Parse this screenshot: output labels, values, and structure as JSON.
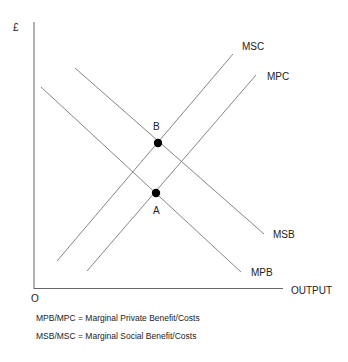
{
  "diagram": {
    "axes": {
      "y_label": "£",
      "x_label": "OUTPUT",
      "origin_label": "O"
    },
    "curves": [
      {
        "name": "MSC",
        "label": "MSC",
        "x1": 57,
        "y1": 261,
        "x2": 233,
        "y2": 54
      },
      {
        "name": "MPC",
        "label": "MPC",
        "x1": 87,
        "y1": 271,
        "x2": 256,
        "y2": 75
      },
      {
        "name": "MSB",
        "label": "MSB",
        "x1": 75,
        "y1": 68,
        "x2": 264,
        "y2": 234
      },
      {
        "name": "MPB",
        "label": "MPB",
        "x1": 41,
        "y1": 87,
        "x2": 241,
        "y2": 272
      }
    ],
    "points": [
      {
        "name": "B",
        "label": "B",
        "cx": 158,
        "cy": 143
      },
      {
        "name": "A",
        "label": "A",
        "cx": 156,
        "cy": 193
      }
    ],
    "legend": [
      "MPB/MPC = Marginal Private Benefit/Costs",
      "MSB/MSC = Marginal Social Benefit/Costs"
    ],
    "colors": {
      "axis": "#666666",
      "curve": "#777777",
      "point": "#000000",
      "text": "#222222"
    }
  }
}
